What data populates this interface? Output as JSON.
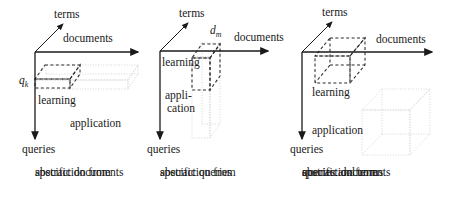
{
  "figure": {
    "title": "",
    "background_color": "#ffffff",
    "axis_color": "#1a1a1a",
    "dashed_region_color": "#333333",
    "dotted_region_color": "#cccccc",
    "panels": [
      {
        "id": "panel-1",
        "axes": {
          "terms": "terms",
          "documents": "documents",
          "queries": "queries"
        },
        "labels": {
          "query_point": "q",
          "query_point_sub": "k",
          "learning": "learning",
          "application": "application"
        },
        "caption": [
          "abstraction from",
          "specific documents"
        ]
      },
      {
        "id": "panel-2",
        "axes": {
          "terms": "terms",
          "documents": "documents",
          "queries": "queries"
        },
        "labels": {
          "document_point": "d",
          "document_point_sub": "m",
          "learning": "learning",
          "application_line1": "appli-",
          "application_line2": "cation"
        },
        "caption": [
          "abstraction from",
          "specific queries"
        ]
      },
      {
        "id": "panel-3",
        "axes": {
          "terms": "terms",
          "documents": "documents",
          "queries": "queries"
        },
        "labels": {
          "learning": "learning",
          "application": "application"
        },
        "caption": [
          "abstraction from",
          "specific documents",
          "queries and terms"
        ]
      }
    ]
  }
}
